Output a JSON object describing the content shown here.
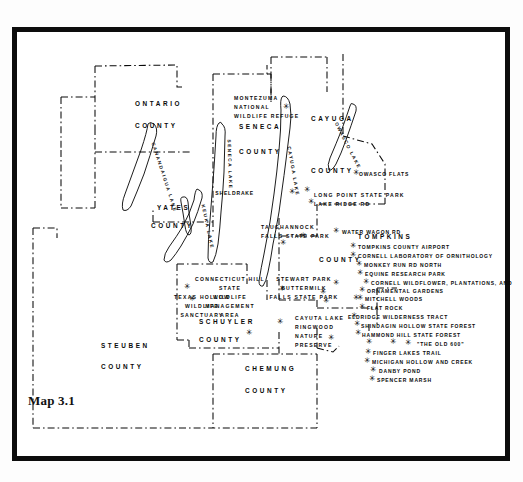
{
  "caption": "Map 3.1",
  "counties": [
    {
      "name": "ONTARIO",
      "word2": "COUNTY",
      "x": 118,
      "y": 68,
      "x2": 118,
      "y2": 90
    },
    {
      "name": "SENECA",
      "word2": "COUNTY",
      "x": 222,
      "y": 91,
      "x2": 222,
      "y2": 116
    },
    {
      "name": "CAYUGA",
      "word2": "COUNTY",
      "x": 294,
      "y": 83,
      "x2": 294,
      "y2": 135
    },
    {
      "name": "YATES",
      "word2": "COUNTY",
      "x": 140,
      "y": 172,
      "x2": 134,
      "y2": 190
    },
    {
      "name": "TOMPKINS",
      "word2": "COUNTY",
      "x": 341,
      "y": 201,
      "x2": 302,
      "y2": 224
    },
    {
      "name": "SCHUYLER",
      "word2": "COUNTY",
      "x": 182,
      "y": 286,
      "x2": 182,
      "y2": 304
    },
    {
      "name": "STEUBEN",
      "word2": "COUNTY",
      "x": 84,
      "y": 310,
      "x2": 84,
      "y2": 331
    },
    {
      "name": "CHEMUNG",
      "word2": "COUNTY",
      "x": 228,
      "y": 333,
      "x2": 228,
      "y2": 355
    }
  ],
  "refuge": {
    "line1": "MONTEZUMA",
    "line2": "NATIONAL",
    "line3": "WILDLIFE REFUGE",
    "x": 217,
    "y": 63
  },
  "lakes": [
    {
      "name": "CANANDAIGUA LAKE",
      "x": 136,
      "y": 108,
      "rot": 72
    },
    {
      "name": "SENECA   LAKE",
      "x": 212,
      "y": 105,
      "rot": 88
    },
    {
      "name": "KEUKA  LAKE",
      "x": 186,
      "y": 170,
      "rot": 78
    },
    {
      "name": "CAYUGA   LAKE",
      "x": 272,
      "y": 112,
      "rot": 80
    },
    {
      "name": "OWASCO LAKE",
      "x": 319,
      "y": 88,
      "rot": 63
    }
  ],
  "multiline_labels": [
    {
      "lines": [
        "TAUGHANNOCK",
        "FALLS STATE PARK"
      ],
      "x": 244,
      "y": 192,
      "align": "left"
    },
    {
      "lines": [
        "CONNECTICUT HILL",
        "STATE",
        "WILDLIFE",
        "MANAGEMENT",
        "AREA"
      ],
      "x": 213,
      "y": 244,
      "align": "center"
    },
    {
      "lines": [
        "TEXAS HOLLOW",
        "WILDLIFE",
        "SANCTUARY"
      ],
      "x": 185,
      "y": 262,
      "align": "center"
    },
    {
      "lines": [
        "STEWART PARK",
        "BUTTERMILK",
        "FALLS STATE PARK"
      ],
      "x": 287,
      "y": 244,
      "align": "center"
    },
    {
      "lines": [
        "CAYUTA LAKE",
        "RINGWOOD",
        "NATURE",
        "PRESERVE"
      ],
      "x": 278,
      "y": 283,
      "align": "left"
    },
    {
      "lines": [
        "LONG POINT STATE PARK",
        "LAKE RIDGE RD"
      ],
      "x": 297,
      "y": 160,
      "align": "left"
    }
  ],
  "sites": [
    {
      "label": "OWASCO FLATS",
      "tx": 342,
      "ty": 139,
      "sx": 336,
      "sy": 137
    },
    {
      "label": "SHELDRAKE",
      "tx": 237,
      "ty": 158,
      "sx": 272,
      "sy": 156,
      "labelright": true
    },
    {
      "label": "WATER WAGON RD",
      "tx": 325,
      "ty": 197,
      "sx": 316,
      "sy": 195
    },
    {
      "label": "TOMPKINS COUNTY AIRPORT",
      "tx": 341,
      "ty": 212,
      "sx": 333,
      "sy": 210
    },
    {
      "label": "CORNELL LABORATORY OF ORNITHOLOGY",
      "tx": 341,
      "ty": 221,
      "sx": 333,
      "sy": 219
    },
    {
      "label": "MONKEY RUN RD NORTH",
      "tx": 347,
      "ty": 230,
      "sx": 339,
      "sy": 228
    },
    {
      "label": "EQUINE  RESEARCH PARK",
      "tx": 348,
      "ty": 239,
      "sx": 340,
      "sy": 237
    },
    {
      "label": "CORNELL WILDFLOWER, PLANTATIONS, AND",
      "tx": 354,
      "ty": 248,
      "sx": 346,
      "sy": 246
    },
    {
      "label": "ORNAMENTAL GARDENS",
      "tx": 350,
      "ty": 256,
      "sx": 342,
      "sy": 254
    },
    {
      "label": "MITCHELL WOODS",
      "tx": 348,
      "ty": 264,
      "sx": 340,
      "sy": 262
    },
    {
      "label": "FLAT ROCK",
      "tx": 350,
      "ty": 273,
      "sx": 342,
      "sy": 271
    },
    {
      "label": "ELDRIDGE WILDERNESS TRACT",
      "tx": 331,
      "ty": 282,
      "sx": 334,
      "sy": 280
    },
    {
      "label": "SHINDAGIN HOLLOW STATE FOREST",
      "tx": 344,
      "ty": 291,
      "sx": 337,
      "sy": 288
    },
    {
      "label": "HAMMOND HILL STATE FOREST",
      "tx": 345,
      "ty": 300,
      "sx": 338,
      "sy": 297
    },
    {
      "label": "\"THE OLD 600\"",
      "tx": 400,
      "ty": 309,
      "sx": 349,
      "sy": 306
    },
    {
      "label": "FINGER LAKES TRAIL",
      "tx": 356,
      "ty": 318,
      "sx": 348,
      "sy": 316
    },
    {
      "label": "MICHIGAN HOLLOW AND CREEK",
      "tx": 355,
      "ty": 327,
      "sx": 347,
      "sy": 325
    },
    {
      "label": "DANBY  POND",
      "tx": 362,
      "ty": 336,
      "sx": 353,
      "sy": 334
    },
    {
      "label": "SPENCER  MARSH",
      "tx": 360,
      "ty": 345,
      "sx": 352,
      "sy": 343
    }
  ],
  "loose_stars": [
    {
      "sx": 266,
      "sy": 71
    },
    {
      "sx": 287,
      "sy": 154
    },
    {
      "sx": 291,
      "sy": 166
    },
    {
      "sx": 283,
      "sy": 200
    },
    {
      "sx": 172,
      "sy": 263
    },
    {
      "sx": 167,
      "sy": 251
    },
    {
      "sx": 229,
      "sy": 297
    },
    {
      "sx": 260,
      "sy": 286
    },
    {
      "sx": 311,
      "sy": 302
    },
    {
      "sx": 262,
      "sy": 253
    },
    {
      "sx": 303,
      "sy": 256
    },
    {
      "sx": 306,
      "sy": 265
    },
    {
      "sx": 263,
      "sy": 207
    },
    {
      "sx": 316,
      "sy": 247
    },
    {
      "sx": 373,
      "sy": 306
    },
    {
      "sx": 388,
      "sy": 307
    },
    {
      "sx": 336,
      "sy": 262
    }
  ],
  "colors": {
    "ink": "#0a0a0a",
    "frame": "#0d0d0d",
    "paper": "#ffffff"
  }
}
